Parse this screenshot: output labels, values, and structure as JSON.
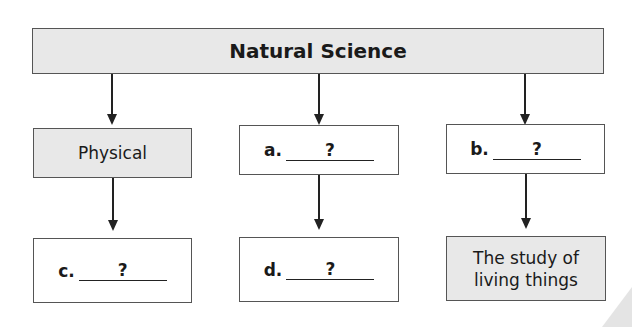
{
  "diagram": {
    "root": {
      "label": "Natural Science"
    },
    "branches": [
      {
        "top": {
          "prefix": "",
          "label": "Physical"
        },
        "bottom": {
          "prefix": "c.",
          "blank": "?"
        }
      },
      {
        "top": {
          "prefix": "a.",
          "blank": "?"
        },
        "bottom": {
          "prefix": "d.",
          "blank": "?"
        }
      },
      {
        "top": {
          "prefix": "b.",
          "blank": "?"
        },
        "bottom": {
          "line1": "The study of",
          "line2": "living things"
        }
      }
    ]
  }
}
